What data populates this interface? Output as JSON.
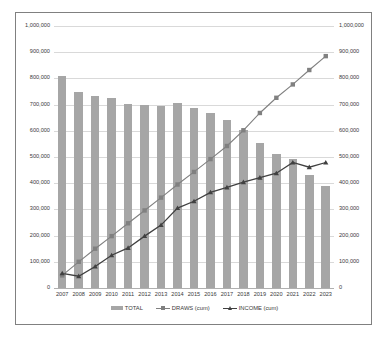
{
  "chart_data": {
    "type": "bar",
    "title": "",
    "subtitle": "",
    "xlabel": "",
    "ylabel": "",
    "ylabel_right": "",
    "ylim": [
      0,
      1000000
    ],
    "ylim_right": [
      0,
      1000000
    ],
    "grid": true,
    "legend_position": "bottom",
    "dual_axis": true,
    "categories": [
      "2007",
      "2008",
      "2009",
      "2010",
      "2011",
      "2012",
      "2013",
      "2014",
      "2015",
      "2016",
      "2017",
      "2018",
      "2019",
      "2020",
      "2021",
      "2022",
      "2023"
    ],
    "ytick_labels": [
      "1,000,000",
      "900,000",
      "800,000",
      "700,000",
      "600,000",
      "500,000",
      "400,000",
      "300,000",
      "200,000",
      "100,000",
      "0"
    ],
    "ytick_values": [
      1000000,
      900000,
      800000,
      700000,
      600000,
      500000,
      400000,
      300000,
      200000,
      100000,
      0
    ],
    "ytick_labels_right": [
      "1,000,000",
      "900,000",
      "800,000",
      "700,000",
      "600,000",
      "500,000",
      "400,000",
      "300,000",
      "200,000",
      "100,000",
      "0"
    ],
    "series": [
      {
        "name": "TOTAL",
        "type": "bar",
        "color": "#a6a6a6",
        "values": [
          808000,
          748000,
          731000,
          726000,
          703000,
          700000,
          694000,
          707000,
          688000,
          669000,
          642000,
          603000,
          553000,
          513000,
          494000,
          431000,
          391000
        ]
      },
      {
        "name": "DRAWS (cum)",
        "type": "line",
        "color": "#808080",
        "marker": "square",
        "values": [
          48000,
          100000,
          150000,
          198000,
          247000,
          296000,
          345000,
          395000,
          443000,
          492000,
          542000,
          602000,
          668000,
          726000,
          777000,
          832000,
          885000
        ]
      },
      {
        "name": "INCOME (cum)",
        "type": "line",
        "color": "#404040",
        "marker": "triangle",
        "values": [
          56000,
          45000,
          82000,
          125000,
          153000,
          198000,
          240000,
          305000,
          331000,
          365000,
          384000,
          404000,
          421000,
          438000,
          479000,
          461000,
          479000
        ]
      }
    ]
  },
  "legend": {
    "items": [
      {
        "label": "TOTAL",
        "kind": "bar",
        "color": "#a6a6a6"
      },
      {
        "label": "DRAWS (cum)",
        "kind": "line-square",
        "color": "#808080"
      },
      {
        "label": "INCOME (cum)",
        "kind": "line-triangle",
        "color": "#404040"
      }
    ]
  }
}
